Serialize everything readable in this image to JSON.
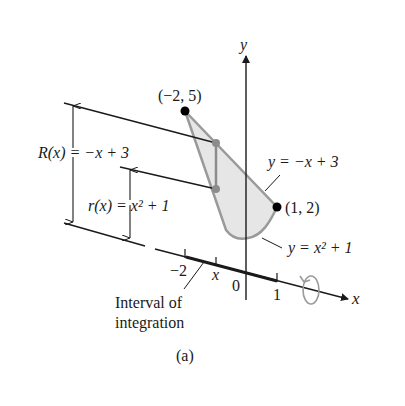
{
  "figure": {
    "caption": "(a)",
    "axes": {
      "x_label": "x",
      "y_label": "y",
      "origin_label": "0",
      "tick_neg2": "−2",
      "tick_1": "1",
      "tick_x": "x"
    },
    "points": {
      "top_left": "(−2, 5)",
      "right": "(1, 2)"
    },
    "curves": {
      "line_label": "y = −x + 3",
      "parabola_label": "y = x² + 1"
    },
    "radii": {
      "outer": "R(x) = −x + 3",
      "inner": "r(x) = x² + 1"
    },
    "annotation": {
      "line1": "Interval of",
      "line2": "integration"
    },
    "icons": [
      "rotation-arrow-icon"
    ],
    "colors": {
      "region_fill": "#e6e6e6",
      "region_stroke": "#9a9a9a",
      "line": "#1a1a1a",
      "gray_dot": "#8c8c8c"
    }
  }
}
